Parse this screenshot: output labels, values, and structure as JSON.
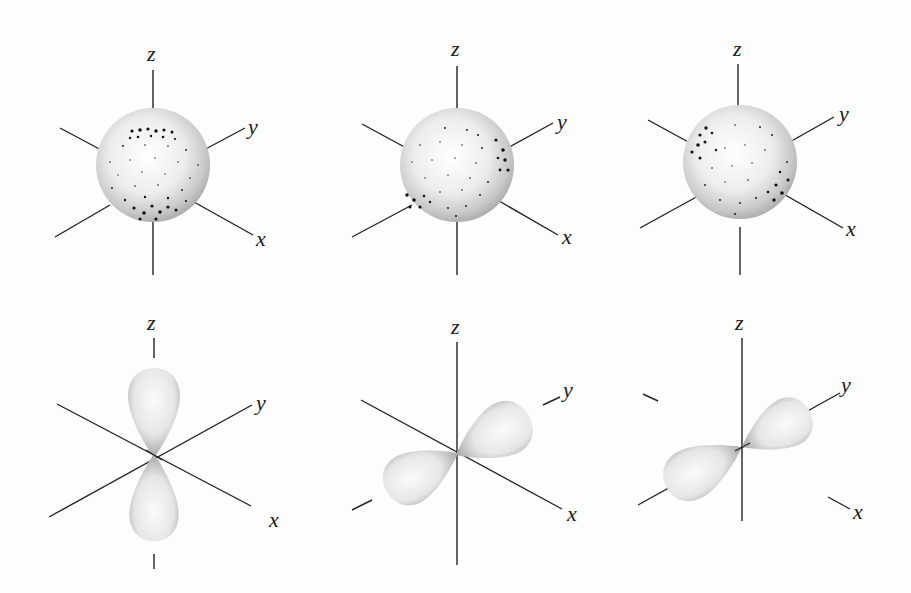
{
  "figure": {
    "axis_labels": {
      "x": "x",
      "y": "y",
      "z": "z"
    },
    "rows": [
      {
        "name": "top-row",
        "panels": [
          {
            "id": "sphere-1",
            "type": "s-orbital-sphere",
            "dense_dots": "top-and-bottom"
          },
          {
            "id": "sphere-2",
            "type": "s-orbital-sphere",
            "dense_dots": "right-and-lower-left"
          },
          {
            "id": "sphere-3",
            "type": "s-orbital-sphere",
            "dense_dots": "upper-left-and-lower-right"
          }
        ]
      },
      {
        "name": "bottom-row",
        "panels": [
          {
            "id": "p-z",
            "type": "p-orbital",
            "lobe_axis": "z"
          },
          {
            "id": "p-y",
            "type": "p-orbital",
            "lobe_axis": "y"
          },
          {
            "id": "p-x",
            "type": "p-orbital",
            "lobe_axis": "x"
          }
        ]
      }
    ],
    "colors": {
      "background": "#fdfdfd",
      "axis": "#222222",
      "lobe_light": "#f4f4f4",
      "lobe_dark": "#9a9a9a",
      "dots": "#111111"
    }
  }
}
